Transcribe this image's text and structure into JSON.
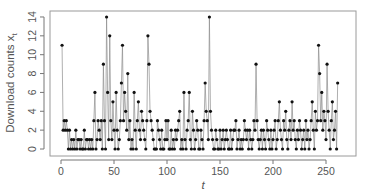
{
  "chart_data": {
    "type": "line",
    "style": "points-and-vertical-lines",
    "title": "",
    "xlabel": "t",
    "ylabel": "Download counts x_t",
    "ylabel_main": "Download counts x",
    "ylabel_sub": "t",
    "xlim": [
      0,
      270
    ],
    "ylim": [
      0,
      14
    ],
    "xticks": [
      0,
      50,
      100,
      150,
      200,
      250
    ],
    "yticks": [
      0,
      2,
      4,
      6,
      8,
      10,
      12,
      14
    ],
    "grid": false,
    "legend": null,
    "x_start": 1,
    "values": [
      11,
      2,
      3,
      2,
      3,
      2,
      0,
      2,
      0,
      1,
      0,
      1,
      0,
      2,
      0,
      1,
      1,
      0,
      1,
      0,
      0,
      2,
      0,
      1,
      1,
      0,
      1,
      0,
      1,
      0,
      3,
      6,
      0,
      1,
      3,
      2,
      1,
      3,
      0,
      9,
      3,
      0,
      14,
      6,
      1,
      12,
      3,
      1,
      5,
      2,
      0,
      6,
      2,
      0,
      1,
      3,
      7,
      11,
      3,
      6,
      4,
      2,
      8,
      1,
      3,
      0,
      1,
      0,
      6,
      2,
      0,
      3,
      5,
      2,
      1,
      4,
      3,
      2,
      1,
      0,
      3,
      12,
      9,
      4,
      3,
      2,
      1,
      0,
      0,
      0,
      3,
      2,
      1,
      0,
      2,
      0,
      0,
      1,
      3,
      1,
      3,
      0,
      0,
      2,
      0,
      1,
      0,
      2,
      1,
      2,
      3,
      4,
      0,
      1,
      0,
      6,
      1,
      0,
      2,
      3,
      6,
      1,
      0,
      4,
      2,
      0,
      1,
      3,
      2,
      0,
      0,
      2,
      1,
      0,
      3,
      7,
      4,
      3,
      1,
      14,
      4,
      2,
      1,
      0,
      0,
      2,
      1,
      0,
      0,
      2,
      0,
      1,
      2,
      0,
      1,
      2,
      1,
      0,
      0,
      2,
      0,
      1,
      2,
      2,
      3,
      0,
      1,
      2,
      0,
      1,
      0,
      1,
      3,
      2,
      1,
      2,
      0,
      2,
      1,
      0,
      1,
      3,
      2,
      9,
      3,
      1,
      0,
      1,
      2,
      0,
      2,
      1,
      0,
      3,
      2,
      1,
      0,
      2,
      0,
      1,
      2,
      3,
      0,
      1,
      3,
      5,
      2,
      1,
      0,
      3,
      2,
      4,
      1,
      0,
      2,
      3,
      1,
      5,
      2,
      3,
      1,
      0,
      2,
      1,
      3,
      2,
      0,
      1,
      2,
      0,
      3,
      1,
      2,
      0,
      1,
      3,
      5,
      2,
      0,
      4,
      2,
      3,
      11,
      8,
      3,
      6,
      2,
      4,
      3,
      1,
      9,
      4,
      2,
      0,
      3,
      5,
      1,
      2,
      4,
      0,
      7
    ]
  }
}
